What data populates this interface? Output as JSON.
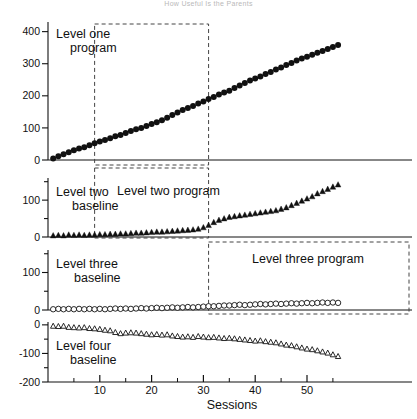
{
  "figure": {
    "title": "How Useful Is the Parents",
    "title_visible": "partially cropped",
    "xlabel": "Sessions",
    "background": "#ffffff",
    "ink": "#111111"
  },
  "annotations": {
    "level_one_program": "Level one\nprogram",
    "level_two_baseline": "Level two\nbaseline",
    "level_two_program": "Level two program",
    "level_three_baseline": "Level three\nbaseline",
    "level_three_program": "Level three program",
    "level_four_baseline": "Level four\nbaseline"
  },
  "chart_data": [
    {
      "type": "scatter",
      "panel": 1,
      "panel_label": "Level one",
      "marker": "filled-circle",
      "title": "Level one program",
      "xlabel": "",
      "ylabel": "",
      "xlim": [
        0,
        57
      ],
      "ylim": [
        0,
        430
      ],
      "yticks": [
        0,
        100,
        200,
        300,
        400
      ],
      "ytick_labels": [
        "0",
        "100",
        "200",
        "300",
        "400"
      ],
      "grid": false,
      "phase_lines": [
        9,
        31
      ],
      "annotation_boxes": [
        {
          "label": "Level one program",
          "x_start": 1,
          "x_end": 31,
          "y_top": 410,
          "y_bottom": 0
        }
      ],
      "x": [
        1,
        2,
        3,
        4,
        5,
        6,
        7,
        8,
        9,
        10,
        11,
        12,
        13,
        14,
        15,
        16,
        17,
        18,
        19,
        20,
        21,
        22,
        23,
        24,
        25,
        26,
        27,
        28,
        29,
        30,
        31,
        32,
        33,
        34,
        35,
        36,
        37,
        38,
        39,
        40,
        41,
        42,
        43,
        44,
        45,
        46,
        47,
        48,
        49,
        50,
        51,
        52,
        53,
        54,
        55,
        56
      ],
      "y": [
        5,
        12,
        18,
        24,
        30,
        36,
        40,
        46,
        52,
        58,
        62,
        68,
        74,
        78,
        84,
        90,
        96,
        100,
        106,
        112,
        118,
        124,
        132,
        140,
        148,
        156,
        162,
        168,
        176,
        182,
        190,
        196,
        204,
        210,
        216,
        224,
        232,
        240,
        248,
        254,
        260,
        268,
        274,
        282,
        288,
        296,
        302,
        310,
        316,
        322,
        328,
        334,
        340,
        346,
        352,
        358
      ]
    },
    {
      "type": "scatter",
      "panel": 2,
      "panel_label": "Level two",
      "marker": "filled-triangle",
      "xlim": [
        0,
        57
      ],
      "ylim": [
        0,
        160
      ],
      "yticks": [
        0,
        50,
        100,
        150
      ],
      "ytick_labels": [
        "0",
        "",
        "100",
        ""
      ],
      "grid": false,
      "phase_lines": [
        9,
        31
      ],
      "annotation_boxes": [
        {
          "label": "Level two baseline",
          "x_start": 0,
          "x_end": 9
        },
        {
          "label": "Level two program",
          "x_start": 9,
          "x_end": 31
        }
      ],
      "x": [
        1,
        2,
        3,
        4,
        5,
        6,
        7,
        8,
        9,
        10,
        11,
        12,
        13,
        14,
        15,
        16,
        17,
        18,
        19,
        20,
        21,
        22,
        23,
        24,
        25,
        26,
        27,
        28,
        29,
        30,
        31,
        32,
        33,
        34,
        35,
        36,
        37,
        38,
        39,
        40,
        41,
        42,
        43,
        44,
        45,
        46,
        47,
        48,
        49,
        50,
        51,
        52,
        53,
        54,
        55,
        56
      ],
      "y": [
        4,
        5,
        4,
        6,
        5,
        6,
        5,
        6,
        6,
        7,
        7,
        8,
        8,
        9,
        9,
        10,
        11,
        11,
        12,
        13,
        14,
        14,
        15,
        16,
        17,
        18,
        19,
        20,
        22,
        26,
        32,
        40,
        46,
        50,
        54,
        56,
        58,
        60,
        62,
        64,
        66,
        68,
        70,
        72,
        76,
        80,
        86,
        92,
        98,
        104,
        110,
        118,
        124,
        130,
        136,
        142
      ]
    },
    {
      "type": "scatter",
      "panel": 3,
      "panel_label": "Level three",
      "marker": "open-circle",
      "xlim": [
        0,
        57
      ],
      "ylim": [
        0,
        160
      ],
      "yticks": [
        0,
        50,
        100,
        150
      ],
      "ytick_labels": [
        "0",
        "",
        "100",
        ""
      ],
      "grid": false,
      "phase_lines": [
        31
      ],
      "annotation_boxes": [
        {
          "label": "Level three baseline",
          "x_start": 0,
          "x_end": 31
        },
        {
          "label": "Level three program",
          "x_start": 31,
          "x_end": 57
        }
      ],
      "x": [
        1,
        2,
        3,
        4,
        5,
        6,
        7,
        8,
        9,
        10,
        11,
        12,
        13,
        14,
        15,
        16,
        17,
        18,
        19,
        20,
        21,
        22,
        23,
        24,
        25,
        26,
        27,
        28,
        29,
        30,
        31,
        32,
        33,
        34,
        35,
        36,
        37,
        38,
        39,
        40,
        41,
        42,
        43,
        44,
        45,
        46,
        47,
        48,
        49,
        50,
        51,
        52,
        53,
        54,
        55,
        56
      ],
      "y": [
        2,
        3,
        2,
        3,
        2,
        3,
        2,
        3,
        2,
        3,
        2,
        3,
        4,
        3,
        4,
        3,
        4,
        5,
        4,
        5,
        6,
        5,
        6,
        7,
        6,
        7,
        8,
        7,
        8,
        9,
        10,
        10,
        11,
        12,
        12,
        13,
        14,
        13,
        14,
        15,
        16,
        15,
        16,
        17,
        16,
        17,
        18,
        17,
        18,
        19,
        18,
        19,
        20,
        19,
        20,
        19
      ]
    },
    {
      "type": "scatter",
      "panel": 4,
      "panel_label": "Level four",
      "marker": "open-triangle",
      "xlim": [
        0,
        57
      ],
      "ylim": [
        -200,
        10
      ],
      "yticks": [
        -200,
        -150,
        -100,
        -50,
        0
      ],
      "ytick_labels": [
        "-200",
        "",
        "-100",
        "",
        "0"
      ],
      "grid": false,
      "phase_lines": [],
      "annotation_boxes": [
        {
          "label": "Level four baseline",
          "x_start": 0,
          "x_end": 57
        }
      ],
      "x": [
        1,
        2,
        3,
        4,
        5,
        6,
        7,
        8,
        9,
        10,
        11,
        12,
        13,
        14,
        15,
        16,
        17,
        18,
        19,
        20,
        21,
        22,
        23,
        24,
        25,
        26,
        27,
        28,
        29,
        30,
        31,
        32,
        33,
        34,
        35,
        36,
        37,
        38,
        39,
        40,
        41,
        42,
        43,
        44,
        45,
        46,
        47,
        48,
        49,
        50,
        51,
        52,
        53,
        54,
        55,
        56
      ],
      "y": [
        -4,
        -5,
        -4,
        -8,
        -9,
        -10,
        -9,
        -12,
        -13,
        -15,
        -18,
        -20,
        -26,
        -30,
        -28,
        -27,
        -28,
        -30,
        -32,
        -34,
        -33,
        -35,
        -34,
        -38,
        -40,
        -42,
        -41,
        -43,
        -40,
        -42,
        -44,
        -43,
        -45,
        -47,
        -46,
        -48,
        -50,
        -52,
        -54,
        -56,
        -55,
        -58,
        -60,
        -62,
        -66,
        -70,
        -72,
        -76,
        -80,
        -84,
        -86,
        -90,
        -94,
        -98,
        -104,
        -110
      ]
    }
  ],
  "xaxis": {
    "label": "Sessions",
    "ticks": [
      10,
      20,
      30,
      40,
      50
    ],
    "tick_labels": [
      "10",
      "20",
      "30",
      "40",
      "50"
    ],
    "minor_ticks": [
      5,
      15,
      25,
      35,
      45,
      55
    ]
  }
}
